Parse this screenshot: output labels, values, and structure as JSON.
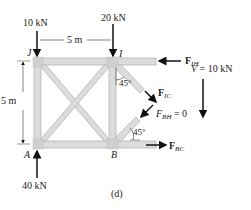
{
  "figure": {
    "caption": "(d)",
    "loads": {
      "J_load": "10 kN",
      "I_load": "20 kN",
      "A_reaction": "40 kN"
    },
    "dimensions": {
      "horizontal": "5 m",
      "vertical": "5 m"
    },
    "joints": {
      "J": "J",
      "I": "I",
      "A": "A",
      "B": "B"
    },
    "forces": {
      "F_IH": {
        "main": "F",
        "sub": "IH"
      },
      "F_IC": {
        "main": "F",
        "sub": "IC"
      },
      "F_BH": {
        "main": "F",
        "sub": "BH",
        "suffix": " = 0"
      },
      "F_BC": {
        "main": "F",
        "sub": "BC"
      }
    },
    "shear": {
      "label": "V",
      "value": " = 10 kN"
    },
    "angles": {
      "top": "45°",
      "bottom": "45°"
    },
    "colors": {
      "member_fill": "#dcdcdc",
      "member_stroke": "#b8b8b8",
      "arrow": "#111111"
    }
  }
}
